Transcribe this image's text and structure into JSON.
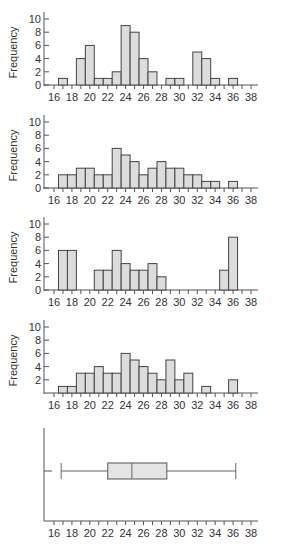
{
  "chart_data": [
    {
      "type": "bar",
      "title": "",
      "xlabel": "",
      "ylabel": "Frequency",
      "bin_width": 1,
      "bin_start": 16.5,
      "xlim": [
        15.5,
        38.5
      ],
      "ylim": [
        0,
        10.5
      ],
      "x_ticks": [
        16,
        18,
        20,
        22,
        24,
        26,
        28,
        30,
        32,
        34,
        36,
        38
      ],
      "y_ticks": [
        0,
        2,
        4,
        6,
        8,
        10
      ],
      "values": [
        1,
        0,
        4,
        6,
        1,
        1,
        2,
        9,
        8,
        4,
        2,
        0,
        1,
        1,
        0,
        5,
        4,
        1,
        0,
        1,
        0,
        0
      ]
    },
    {
      "type": "bar",
      "title": "",
      "xlabel": "",
      "ylabel": "Frequency",
      "bin_width": 1,
      "bin_start": 16.5,
      "xlim": [
        15.5,
        38.5
      ],
      "ylim": [
        0,
        10.5
      ],
      "x_ticks": [
        16,
        18,
        20,
        22,
        24,
        26,
        28,
        30,
        32,
        34,
        36,
        38
      ],
      "y_ticks": [
        0,
        2,
        4,
        6,
        8,
        10
      ],
      "values": [
        2,
        2,
        3,
        3,
        2,
        2,
        6,
        5,
        4,
        2,
        3,
        4,
        3,
        3,
        2,
        2,
        1,
        1,
        0,
        1,
        0,
        0
      ]
    },
    {
      "type": "bar",
      "title": "",
      "xlabel": "",
      "ylabel": "Frequency",
      "bin_width": 1,
      "bin_start": 16.5,
      "xlim": [
        15.5,
        38.5
      ],
      "ylim": [
        0,
        10.5
      ],
      "x_ticks": [
        16,
        18,
        20,
        22,
        24,
        26,
        28,
        30,
        32,
        34,
        36,
        38
      ],
      "y_ticks": [
        0,
        2,
        4,
        6,
        8,
        10
      ],
      "values": [
        6,
        6,
        0,
        0,
        3,
        3,
        6,
        4,
        3,
        3,
        4,
        2,
        0,
        0,
        0,
        0,
        0,
        0,
        3,
        8,
        0,
        0
      ]
    },
    {
      "type": "bar",
      "title": "",
      "xlabel": "",
      "ylabel": "Frequency",
      "bin_width": 1,
      "bin_start": 16.5,
      "xlim": [
        15.5,
        38.5
      ],
      "ylim": [
        0,
        10.5
      ],
      "x_ticks": [
        16,
        18,
        20,
        22,
        24,
        26,
        28,
        30,
        32,
        34,
        36,
        38
      ],
      "y_ticks": [
        2,
        4,
        6,
        8,
        10
      ],
      "values": [
        1,
        1,
        3,
        3,
        4,
        3,
        3,
        6,
        5,
        4,
        3,
        2,
        5,
        2,
        3,
        0,
        1,
        0,
        0,
        2,
        0,
        0
      ]
    },
    {
      "type": "boxplot",
      "title": "",
      "xlabel": "",
      "ylabel": "",
      "xlim": [
        15.5,
        38.5
      ],
      "x_ticks": [
        16,
        18,
        20,
        22,
        24,
        26,
        28,
        30,
        32,
        34,
        36,
        38
      ],
      "whisker_low": 16.8,
      "q1": 22,
      "median": 24.7,
      "q3": 28.6,
      "whisker_high": 36.3
    }
  ]
}
